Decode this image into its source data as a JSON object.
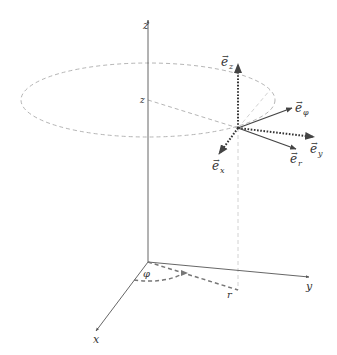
{
  "diagram": {
    "type": "cylindrical-coordinate-system",
    "axes": {
      "x": {
        "label": "x"
      },
      "y": {
        "label": "y"
      },
      "z": {
        "label": "z"
      }
    },
    "height_marker": {
      "label": "z"
    },
    "radius_marker": {
      "label": "r"
    },
    "angle_marker": {
      "label": "φ"
    },
    "unit_vectors": {
      "e_z": {
        "label": "e",
        "subscript": "z",
        "style": "dotted"
      },
      "e_phi": {
        "label": "e",
        "subscript": "φ",
        "style": "solid"
      },
      "e_y": {
        "label": "e",
        "subscript": "y",
        "style": "dotted"
      },
      "e_r": {
        "label": "e",
        "subscript": "r",
        "style": "solid"
      },
      "e_x": {
        "label": "e",
        "subscript": "x",
        "style": "dotted"
      }
    },
    "vector_arrow_glyph": "→",
    "colors": {
      "axis": "#555555",
      "guide": "#b5b5b5",
      "vector": "#444444",
      "label": "#333333"
    }
  }
}
